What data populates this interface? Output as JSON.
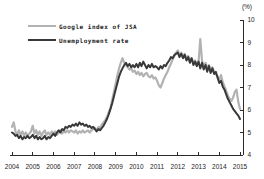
{
  "colors": {
    "background": "#ffffff",
    "axis": "#2a2a2a",
    "tick_label": "#1c1c1c",
    "series_google": "#b2b2b2",
    "series_unemployment": "#383838"
  },
  "chart_data": {
    "type": "line",
    "title": "",
    "unit_label": "(%)",
    "xlabel": "",
    "ylabel": "(%)",
    "x_range": [
      2004,
      2015
    ],
    "x_ticks": [
      "2004",
      "2005",
      "2006",
      "2007",
      "2008",
      "2009",
      "2010",
      "2011",
      "2012",
      "2013",
      "2014",
      "2015"
    ],
    "ylim": [
      4,
      10
    ],
    "y_tick_step": 1,
    "y_ticks": [
      4,
      5,
      6,
      7,
      8,
      9,
      10
    ],
    "grid": false,
    "legend_position": "top-left",
    "points_per_year": 12,
    "x_start_year": 2004,
    "series": [
      {
        "name": "Google index of JSA",
        "color": "#b2b2b2",
        "stroke_width": 2.2,
        "values": [
          5.25,
          5.45,
          5.05,
          4.9,
          5.1,
          4.9,
          5.05,
          4.85,
          5.0,
          4.85,
          4.95,
          5.05,
          5.3,
          4.95,
          5.1,
          4.9,
          5.05,
          4.85,
          5.0,
          5.1,
          4.9,
          5.0,
          4.9,
          5.05,
          4.95,
          5.05,
          4.9,
          5.0,
          5.1,
          4.95,
          5.05,
          5.0,
          5.1,
          5.0,
          5.1,
          5.05,
          5.0,
          5.1,
          4.95,
          5.05,
          5.0,
          5.1,
          5.0,
          5.05,
          5.1,
          5.0,
          5.1,
          5.15,
          5.2,
          5.1,
          5.25,
          5.2,
          5.35,
          5.45,
          5.55,
          5.7,
          5.9,
          6.1,
          6.45,
          6.8,
          7.15,
          7.55,
          7.85,
          8.1,
          8.3,
          8.1,
          8.0,
          7.9,
          7.8,
          7.85,
          7.7,
          7.75,
          7.6,
          7.7,
          7.55,
          7.65,
          7.5,
          7.6,
          7.65,
          7.5,
          7.45,
          7.55,
          7.4,
          7.45,
          7.3,
          7.1,
          7.0,
          7.2,
          7.4,
          7.55,
          7.7,
          7.9,
          8.05,
          8.25,
          8.4,
          8.55,
          8.65,
          8.45,
          8.55,
          8.35,
          8.5,
          8.3,
          8.4,
          8.2,
          8.3,
          8.1,
          8.2,
          8.05,
          8.1,
          9.15,
          8.2,
          7.95,
          8.1,
          7.85,
          8.0,
          7.8,
          7.9,
          7.7,
          7.6,
          7.5,
          7.35,
          7.55,
          7.25,
          7.05,
          6.85,
          6.65,
          6.5,
          6.4,
          6.55,
          6.8,
          6.9,
          6.35,
          6.05
        ]
      },
      {
        "name": "Unemployment rate",
        "color": "#383838",
        "stroke_width": 2.0,
        "values": [
          5.0,
          4.95,
          4.85,
          4.9,
          4.75,
          4.85,
          4.7,
          4.8,
          4.75,
          4.85,
          4.75,
          4.8,
          4.9,
          4.75,
          4.85,
          4.7,
          4.8,
          4.7,
          4.75,
          4.85,
          4.7,
          4.8,
          4.75,
          4.85,
          4.95,
          4.85,
          5.0,
          5.1,
          5.0,
          5.15,
          5.1,
          5.25,
          5.2,
          5.3,
          5.25,
          5.35,
          5.3,
          5.4,
          5.3,
          5.45,
          5.35,
          5.4,
          5.3,
          5.35,
          5.25,
          5.3,
          5.2,
          5.25,
          5.15,
          5.05,
          5.15,
          5.1,
          5.2,
          5.3,
          5.45,
          5.6,
          5.8,
          6.05,
          6.3,
          6.6,
          6.9,
          7.2,
          7.5,
          7.7,
          7.85,
          8.0,
          8.1,
          7.95,
          8.05,
          7.9,
          8.0,
          7.9,
          8.05,
          7.9,
          8.1,
          7.95,
          8.15,
          8.0,
          7.85,
          8.0,
          7.9,
          8.05,
          7.9,
          7.95,
          7.9,
          7.8,
          7.95,
          7.85,
          8.0,
          7.95,
          8.1,
          8.2,
          8.35,
          8.3,
          8.45,
          8.5,
          8.55,
          8.35,
          8.5,
          8.3,
          8.45,
          8.2,
          8.35,
          8.1,
          8.3,
          8.0,
          8.15,
          7.95,
          8.15,
          7.85,
          8.1,
          7.8,
          8.0,
          7.7,
          7.95,
          7.65,
          7.85,
          7.6,
          7.7,
          7.45,
          7.2,
          7.3,
          7.05,
          6.9,
          6.7,
          6.5,
          6.35,
          6.2,
          6.05,
          5.95,
          5.85,
          5.75,
          5.6
        ]
      }
    ]
  }
}
